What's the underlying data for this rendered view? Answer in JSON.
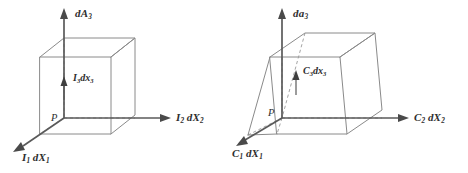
{
  "figure": {
    "caption": "",
    "background_color": "#ffffff",
    "line_color": "#8a8a8a",
    "axis_color": "#5a5a5a",
    "label_color": "#2e2e2e"
  },
  "left_figure": {
    "name": "reference-configuration-cube",
    "shape": "cube",
    "point_label": "P",
    "normal_vector_label": {
      "base": "dA",
      "sub": "3"
    },
    "thickness_vector_label": {
      "base": "I",
      "sub": "3",
      "suffix": "dx",
      "suffix_sub": "3"
    },
    "axis_x1_label": {
      "base": "I",
      "sub": "1",
      "suffix": "dX",
      "suffix_sub": "1"
    },
    "axis_x2_label": {
      "base": "I",
      "sub": "2",
      "suffix": "dX",
      "suffix_sub": "2"
    }
  },
  "right_figure": {
    "name": "deformed-configuration-parallelepiped",
    "shape": "parallelepiped",
    "point_label": "P",
    "normal_vector_label": {
      "base": "da",
      "sub": "3"
    },
    "thickness_vector_label": {
      "base": "C",
      "sub": "3",
      "suffix": "dx",
      "suffix_sub": "3"
    },
    "axis_x1_label": {
      "base": "C",
      "sub": "1",
      "suffix": "dX",
      "suffix_sub": "1"
    },
    "axis_x2_label": {
      "base": "C",
      "sub": "2",
      "suffix": "dX",
      "suffix_sub": "2"
    }
  }
}
